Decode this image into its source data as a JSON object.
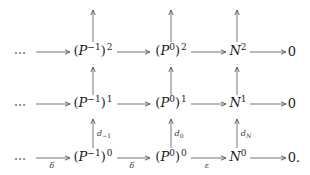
{
  "diagram": {
    "title": "",
    "rows": [
      {
        "name": "row-2",
        "leading": "⋯",
        "nodes": [
          {
            "base": "P",
            "inner_sup": "−1",
            "outer_sup": "2",
            "paren": true
          },
          {
            "base": "P",
            "inner_sup": "0",
            "outer_sup": "2",
            "paren": true
          },
          {
            "base": "N",
            "inner_sup": "",
            "outer_sup": "2",
            "paren": false
          },
          {
            "base": "0",
            "inner_sup": "",
            "outer_sup": "",
            "paren": false,
            "plain": true
          }
        ]
      },
      {
        "name": "row-1",
        "leading": "⋯",
        "nodes": [
          {
            "base": "P",
            "inner_sup": "−1",
            "outer_sup": "1",
            "paren": true
          },
          {
            "base": "P",
            "inner_sup": "0",
            "outer_sup": "1",
            "paren": true
          },
          {
            "base": "N",
            "inner_sup": "",
            "outer_sup": "1",
            "paren": false
          },
          {
            "base": "0",
            "inner_sup": "",
            "outer_sup": "",
            "paren": false,
            "plain": true
          }
        ]
      },
      {
        "name": "row-0",
        "leading": "⋯",
        "nodes": [
          {
            "base": "P",
            "inner_sup": "−1",
            "outer_sup": "0",
            "paren": true
          },
          {
            "base": "P",
            "inner_sup": "0",
            "outer_sup": "0",
            "paren": true
          },
          {
            "base": "N",
            "inner_sup": "",
            "outer_sup": "0",
            "paren": false
          },
          {
            "base": "0.",
            "inner_sup": "",
            "outer_sup": "",
            "paren": false,
            "plain": true
          }
        ]
      }
    ],
    "horizontal_labels": {
      "row0_arrow1": "δ",
      "row0_arrow2": "δ",
      "row0_arrow3": "ε"
    },
    "vertical_labels": {
      "col1": {
        "base": "d",
        "sub": "−1"
      },
      "col2": {
        "base": "d",
        "sub": "0"
      },
      "col3": {
        "base": "d",
        "sub": "N"
      }
    },
    "colors": {
      "arrow": "#555555",
      "text": "#1a1a1a",
      "background": "#ffffff"
    }
  }
}
